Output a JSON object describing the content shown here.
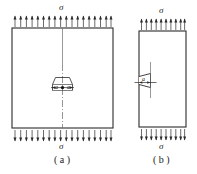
{
  "figure": {
    "type": "engineering-diagram",
    "stroke_color": "#2b2b2b",
    "background_color": "#ffffff"
  },
  "panels": [
    {
      "id": "a",
      "caption": "( a )",
      "crack_type": "central-crack",
      "stress_label_top": "σ",
      "stress_label_bottom": "σ",
      "crack_labels": [
        "a",
        "a"
      ],
      "plate": {
        "x": 12,
        "y": 28,
        "width": 101,
        "height": 100
      },
      "arrow_count_top": 18,
      "arrow_count_bottom": 18,
      "centerline": "dash-dot"
    },
    {
      "id": "b",
      "caption": "( b )",
      "crack_type": "edge-crack",
      "stress_label_top": "σ",
      "stress_label_bottom": "σ",
      "crack_labels": [
        "a"
      ],
      "plate": {
        "x": 139,
        "y": 31,
        "width": 47,
        "height": 96
      },
      "arrow_count_top": 10,
      "arrow_count_bottom": 10,
      "centerline": "none"
    }
  ],
  "labels": {
    "sigma_a_top": "σ",
    "sigma_a_bottom": "σ",
    "sigma_b_top": "σ",
    "sigma_b_bottom": "σ",
    "caption_a": "( a )",
    "caption_b": "( b )",
    "a_left": "a",
    "a_right": "a",
    "a_edge": "a"
  }
}
